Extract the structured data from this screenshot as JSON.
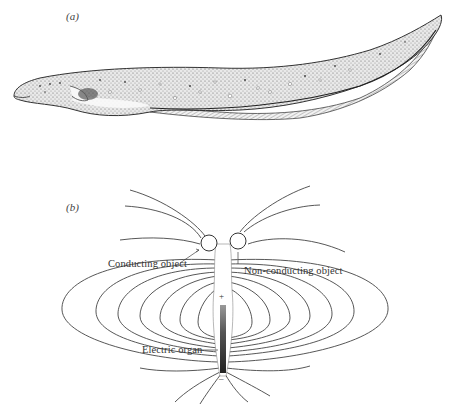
{
  "figure": {
    "panels": [
      {
        "id": "a",
        "label": "(a)",
        "subject": "electric-fish-illustration"
      },
      {
        "id": "b",
        "label": "(b)",
        "subject": "electric-field-diagram",
        "annotations": {
          "conducting_object": "Conducting object",
          "non_conducting_object": "Non-conducting object",
          "electric_organ": "Electric organ",
          "positive_pole": "+",
          "negative_pole": "–"
        }
      }
    ],
    "colors": {
      "ink": "#333333",
      "background": "#ffffff",
      "organ_fill": "#555555"
    }
  }
}
